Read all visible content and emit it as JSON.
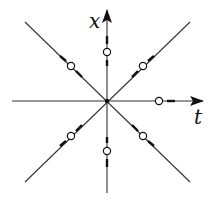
{
  "diagram": {
    "type": "phase-portrait",
    "axes": {
      "horizontal_label": "t",
      "vertical_label": "x"
    },
    "origin": {
      "x": 107,
      "y": 101
    },
    "rays": [
      {
        "name": "ray-up",
        "end": [
          107,
          10
        ],
        "circle": [
          107,
          52
        ],
        "arrow": "outward"
      },
      {
        "name": "ray-down",
        "end": [
          107,
          193
        ],
        "circle": [
          107,
          151
        ],
        "arrow": "outward"
      },
      {
        "name": "ray-right",
        "end": [
          203,
          101
        ],
        "circle": [
          159,
          101
        ],
        "arrow": "outward"
      },
      {
        "name": "ray-left",
        "end": [
          12,
          101
        ],
        "circle": null,
        "arrow": "none"
      },
      {
        "name": "ray-up-left",
        "end": [
          25,
          22
        ],
        "circle": [
          71,
          66
        ],
        "arrow": "outward"
      },
      {
        "name": "ray-up-right",
        "end": [
          190,
          22
        ],
        "circle": [
          143,
          66
        ],
        "arrow": "outward"
      },
      {
        "name": "ray-down-left",
        "end": [
          25,
          182
        ],
        "circle": [
          71,
          136
        ],
        "arrow": "outward"
      },
      {
        "name": "ray-down-right",
        "end": [
          190,
          182
        ],
        "circle": [
          143,
          136
        ],
        "arrow": "outward"
      }
    ],
    "colors": {
      "line": "#222222",
      "circle_fill": "#ffffff"
    }
  }
}
